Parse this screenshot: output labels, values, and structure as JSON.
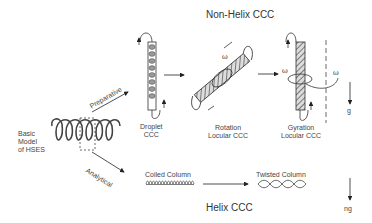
{
  "titles": {
    "top": "Non-Helix CCC",
    "bottom": "Helix CCC"
  },
  "basic_model": {
    "line1": "Basic",
    "line2": "Model",
    "line3": "of HSES"
  },
  "branches": {
    "upper": "Preparative",
    "lower": "Analytical"
  },
  "non_helix_methods": [
    {
      "line1": "Droplet",
      "line2": "CCC"
    },
    {
      "line1": "Rotation",
      "line2": "Locular CCC"
    },
    {
      "line1": "Gyration",
      "line2": "Locular CCC"
    }
  ],
  "helix_methods": [
    {
      "label": "Coiled Column"
    },
    {
      "label": "Twisted Column"
    }
  ],
  "symbols": {
    "omega": "ω",
    "gravity": "g",
    "gravity_n": "ng"
  }
}
